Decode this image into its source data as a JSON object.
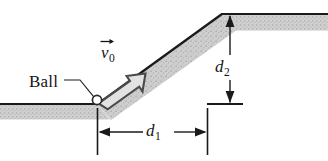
{
  "figure": {
    "background_color": "#ffffff",
    "width": 328,
    "height": 161
  },
  "labels": {
    "ball": "Ball",
    "velocity_symbol": "v",
    "velocity_subscript": "0",
    "velocity_accent": "→",
    "distance1_symbol": "d",
    "distance1_subscript": "1",
    "distance2_symbol": "d",
    "distance2_subscript": "2"
  },
  "colors": {
    "ground_fill": "#c9c9c9",
    "ground_edge": "#1a1a1a",
    "ramp_fill": "#c9c9c9",
    "arrow_stroke": "#3c3c3c",
    "arrow_fill": "#e8e8e8",
    "dimension_line": "#1a1a1a",
    "text": "#151515",
    "ball_fill": "#ffffff",
    "ball_stroke": "#2a2a2a"
  },
  "geometry": {
    "lower_ground_top_y": 104,
    "upper_ground_top_y": 14,
    "ramp_base_x": 97,
    "ramp_top_x": 222,
    "ground_thickness": 15,
    "ball_center_x": 97,
    "ball_center_y": 100,
    "ball_radius": 4.5,
    "d1_start_x": 97,
    "d1_end_x": 207,
    "d1_line_y": 132,
    "d2_x": 230,
    "d2_top_y": 14,
    "d2_bottom_y": 104
  },
  "elements": {
    "lower_ground_name": "lower-ground-surface",
    "upper_ground_name": "upper-ground-surface",
    "ramp_name": "inclined-ramp",
    "ball_name": "ball-marker",
    "velocity_arrow_name": "velocity-vector-arrow",
    "leader_name": "ball-leader-line",
    "d1_name": "horizontal-distance-dimension",
    "d2_name": "vertical-distance-dimension"
  }
}
